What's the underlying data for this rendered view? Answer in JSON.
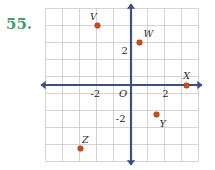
{
  "problem": {
    "number": "55."
  },
  "colors": {
    "axis": "#3d4f80",
    "grid": "#c9c9c9",
    "point": "#cf4a1a",
    "problem_number": "#4a9a6a",
    "label_text": "#1d1d1d"
  },
  "chart_data": {
    "type": "scatter",
    "title": "",
    "xlabel": "",
    "ylabel": "",
    "xlim": [
      -5,
      4.5
    ],
    "ylim": [
      -4.5,
      4.5
    ],
    "grid": true,
    "legend": "none",
    "axis_origin_label": "O",
    "x_tick_labels": [
      "-2",
      "2"
    ],
    "x_tick_values": [
      -2,
      2
    ],
    "y_tick_labels": [
      "2",
      "-2"
    ],
    "y_tick_values": [
      2,
      -2
    ],
    "points": [
      {
        "label": "V",
        "x": -2,
        "y": 3.5,
        "label_dx": -7,
        "label_dy": -14
      },
      {
        "label": "W",
        "x": 0.5,
        "y": 2.5,
        "label_dx": 4,
        "label_dy": -14
      },
      {
        "label": "X",
        "x": 3.25,
        "y": 0,
        "label_dx": -3,
        "label_dy": -14
      },
      {
        "label": "Y",
        "x": 1.5,
        "y": -1.75,
        "label_dx": 3,
        "label_dy": 4
      },
      {
        "label": "Z",
        "x": -3,
        "y": -3.75,
        "label_dx": 2,
        "label_dy": -14
      }
    ]
  },
  "geometry": {
    "cell_px": 17,
    "origin_x_px": 86,
    "origin_y_px": 77,
    "grid_cols": 9,
    "grid_rows": 9
  }
}
